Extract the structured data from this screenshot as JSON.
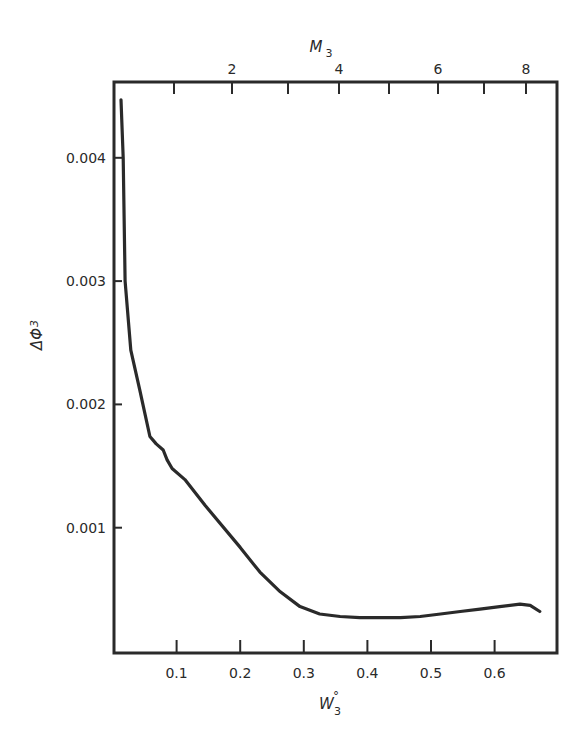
{
  "chart_data": {
    "type": "line",
    "title": "",
    "xlabel": "W₃°",
    "ylabel": "ΔΦ₃",
    "top_xlabel": "M₃",
    "xlim": [
      0,
      0.7
    ],
    "ylim": [
      0,
      0.0047
    ],
    "grid": false,
    "legend": null,
    "x_ticks": [
      0.1,
      0.2,
      0.3,
      0.4,
      0.5,
      0.6
    ],
    "x_tick_labels": [
      "0.1",
      "0.2",
      "0.3",
      "0.4",
      "0.5",
      "0.6"
    ],
    "y_ticks": [
      0.001,
      0.002,
      0.003,
      0.004
    ],
    "y_tick_labels": [
      "0.001",
      "0.002",
      "0.003",
      "0.004"
    ],
    "top_axis": {
      "label": "M₃",
      "minor_ticks_px": [
        174,
        232,
        288,
        339,
        389,
        438,
        484,
        526
      ],
      "tick_values": [
        1,
        2,
        3,
        4,
        5,
        6,
        7,
        8
      ],
      "labeled": [
        {
          "value": "2",
          "px": 232
        },
        {
          "value": "4",
          "px": 339
        },
        {
          "value": "6",
          "px": 438
        },
        {
          "value": "8",
          "px": 526
        }
      ]
    },
    "series": [
      {
        "name": "ΔΦ₃ vs W₃°",
        "x": [
          0.0126,
          0.016,
          0.019,
          0.028,
          0.042,
          0.047,
          0.058,
          0.068,
          0.079,
          0.085,
          0.093,
          0.113,
          0.145,
          0.2,
          0.231,
          0.263,
          0.294,
          0.325,
          0.357,
          0.388,
          0.42,
          0.452,
          0.483,
          0.515,
          0.546,
          0.577,
          0.608,
          0.64,
          0.656,
          0.671
        ],
        "y": [
          0.00447,
          0.004,
          0.003,
          0.00244,
          0.00212,
          0.002,
          0.00174,
          0.00168,
          0.00163,
          0.00155,
          0.00148,
          0.00139,
          0.00118,
          0.00084,
          0.00064,
          0.00048,
          0.00036,
          0.0003,
          0.00028,
          0.00027,
          0.00027,
          0.00027,
          0.00028,
          0.0003,
          0.00032,
          0.00034,
          0.00036,
          0.00038,
          0.00037,
          0.00032
        ]
      }
    ]
  },
  "labels": {
    "x_axis_title": "W",
    "x_axis_sub": "3",
    "x_axis_sup": "°",
    "y_axis_title": "ΔΦ",
    "y_axis_sub": "3",
    "top_axis_title": "M",
    "top_axis_sub": "3"
  },
  "style": {
    "line_color": "#2a2a2a",
    "frame_color": "#2a2a2a",
    "background": "#ffffff"
  }
}
